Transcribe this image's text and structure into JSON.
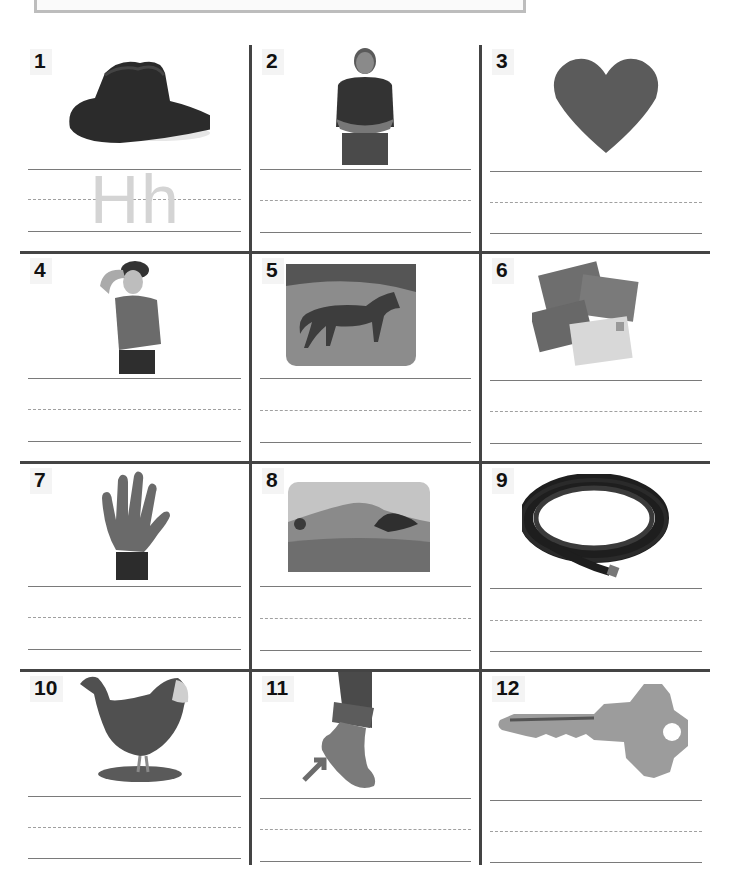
{
  "worksheet": {
    "example_trace": "Hh",
    "items": [
      {
        "number": "1",
        "picture": "cowboy-hat"
      },
      {
        "number": "2",
        "picture": "man"
      },
      {
        "number": "3",
        "picture": "heart"
      },
      {
        "number": "4",
        "picture": "hot-boy"
      },
      {
        "number": "5",
        "picture": "horse"
      },
      {
        "number": "6",
        "picture": "letters"
      },
      {
        "number": "7",
        "picture": "hand"
      },
      {
        "number": "8",
        "picture": "hill"
      },
      {
        "number": "9",
        "picture": "hose"
      },
      {
        "number": "10",
        "picture": "hen"
      },
      {
        "number": "11",
        "picture": "heel"
      },
      {
        "number": "12",
        "picture": "key"
      }
    ]
  },
  "colors": {
    "grid": "#444444",
    "writing_line": "#7a7a7a",
    "trace": "#d4d4d4"
  }
}
